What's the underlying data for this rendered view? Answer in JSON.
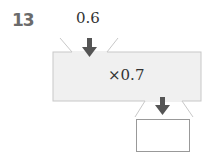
{
  "problem": {
    "number": "13",
    "input_value": "0.6",
    "operation": "×0.7",
    "answer": ""
  },
  "colors": {
    "machine_fill": "#f0f0f0",
    "machine_stroke": "#c8c8c8",
    "arrow": "#555555",
    "number": "#6b6b6b"
  }
}
